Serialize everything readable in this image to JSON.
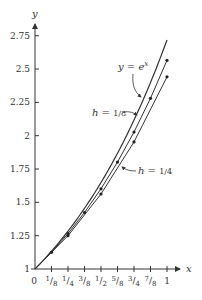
{
  "chart_data": {
    "type": "line",
    "title": "",
    "xlabel": "x",
    "ylabel": "y",
    "xlim": [
      0,
      1
    ],
    "ylim": [
      1,
      2.75
    ],
    "grid": false,
    "legend": "inline annotations",
    "x_ticks": [
      {
        "value": 0,
        "label": "0"
      },
      {
        "value": 0.125,
        "label": "1/8"
      },
      {
        "value": 0.25,
        "label": "1/4"
      },
      {
        "value": 0.375,
        "label": "3/8"
      },
      {
        "value": 0.5,
        "label": "1/2"
      },
      {
        "value": 0.625,
        "label": "5/8"
      },
      {
        "value": 0.75,
        "label": "3/4"
      },
      {
        "value": 0.875,
        "label": "7/8"
      },
      {
        "value": 1,
        "label": "1"
      }
    ],
    "y_ticks": [
      {
        "value": 1,
        "label": "1"
      },
      {
        "value": 1.25,
        "label": "1.25"
      },
      {
        "value": 1.5,
        "label": "1.5"
      },
      {
        "value": 1.75,
        "label": "1.75"
      },
      {
        "value": 2,
        "label": "2"
      },
      {
        "value": 2.25,
        "label": "2.25"
      },
      {
        "value": 2.5,
        "label": "2.5"
      },
      {
        "value": 2.75,
        "label": "2.75"
      }
    ],
    "series": [
      {
        "name": "y = e^x",
        "label_main": "y = e",
        "label_sup": "x",
        "style": "smooth curve",
        "x": [
          0,
          0.125,
          0.25,
          0.375,
          0.5,
          0.625,
          0.75,
          0.875,
          1
        ],
        "values": [
          1,
          1.1331,
          1.284,
          1.455,
          1.6487,
          1.8682,
          2.117,
          2.3989,
          2.7183
        ]
      },
      {
        "name": "h = 1/8",
        "label_main": "h = ",
        "label_frac": "1/8",
        "style": "polyline with points",
        "x": [
          0,
          0.125,
          0.25,
          0.375,
          0.5,
          0.625,
          0.75,
          0.875,
          1
        ],
        "values": [
          1,
          1.125,
          1.2656,
          1.4238,
          1.6018,
          1.802,
          2.0273,
          2.2807,
          2.5658
        ]
      },
      {
        "name": "h = 1/4",
        "label_main": "h = ",
        "label_frac": "1/4",
        "style": "polyline with points",
        "x": [
          0,
          0.25,
          0.5,
          0.75,
          1
        ],
        "values": [
          1,
          1.25,
          1.5625,
          1.9531,
          2.4414
        ]
      }
    ],
    "colors": {
      "axis": "#333333",
      "curve": "#333333",
      "background": "#ffffff"
    }
  }
}
